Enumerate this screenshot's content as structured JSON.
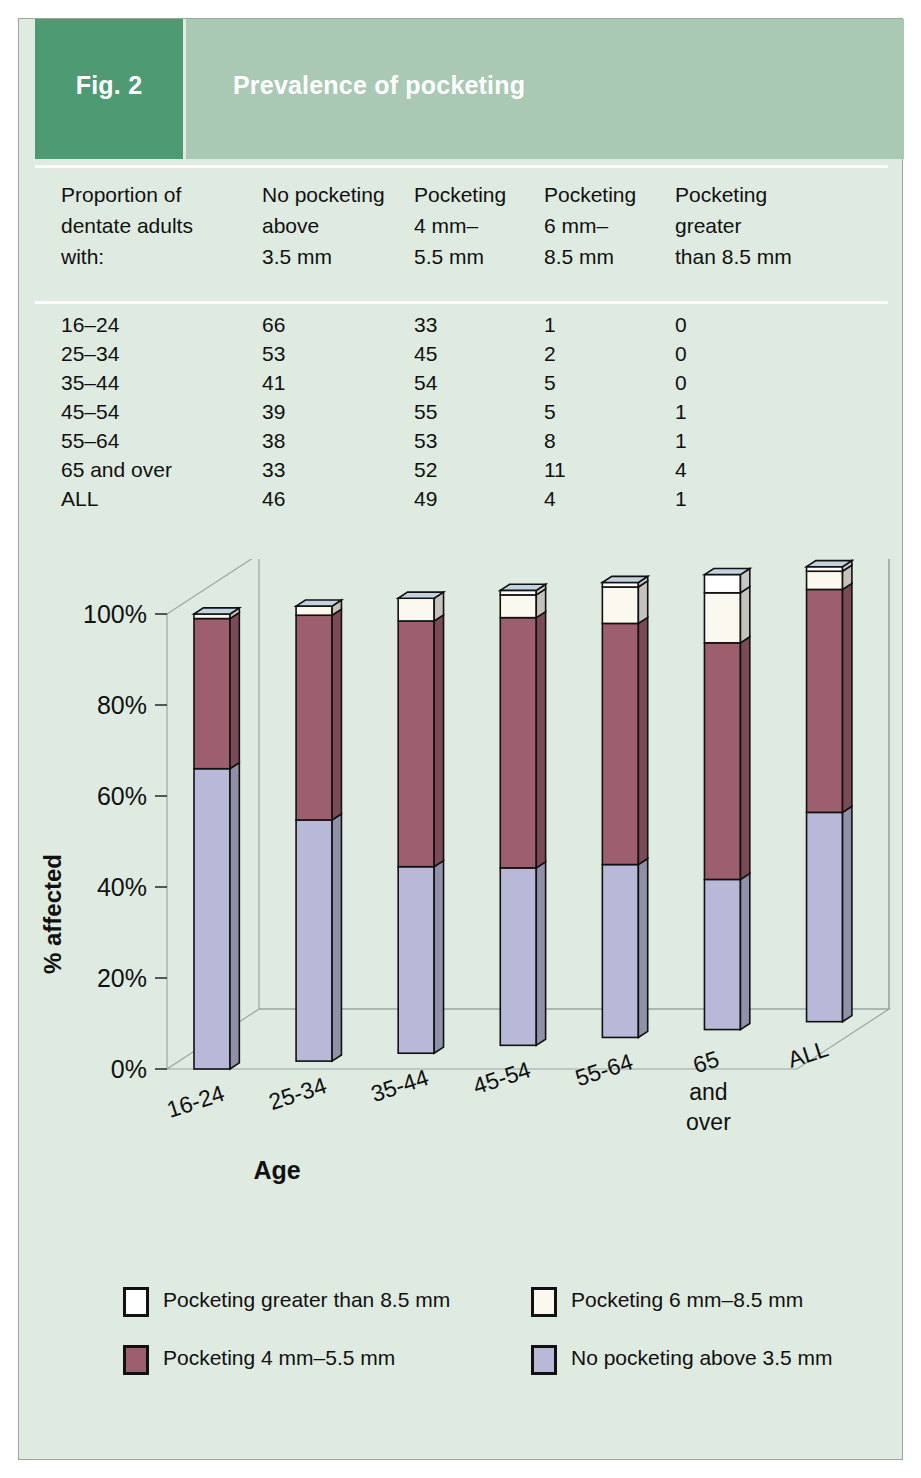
{
  "header": {
    "figure_label": "Fig. 2",
    "title": "Prevalence of pocketing",
    "fig_block_color": "#4e9a72",
    "title_block_color": "#a9c9b5"
  },
  "table": {
    "columns": [
      "Proportion of\ndentate adults\nwith:",
      "No pocketing\nabove\n3.5 mm",
      "Pocketing\n4 mm–\n5.5 mm",
      "Pocketing\n6 mm–\n8.5 mm",
      "Pocketing\ngreater\nthan 8.5 mm"
    ],
    "rows": [
      {
        "age": "16–24",
        "no_pocketing": "66",
        "p4_55": "33",
        "p6_85": "1",
        "p_gt85": "0"
      },
      {
        "age": "25–34",
        "no_pocketing": "53",
        "p4_55": "45",
        "p6_85": "2",
        "p_gt85": "0"
      },
      {
        "age": "35–44",
        "no_pocketing": "41",
        "p4_55": "54",
        "p6_85": "5",
        "p_gt85": "0"
      },
      {
        "age": "45–54",
        "no_pocketing": "39",
        "p4_55": "55",
        "p6_85": "5",
        "p_gt85": "1"
      },
      {
        "age": "55–64",
        "no_pocketing": "38",
        "p4_55": "53",
        "p6_85": "8",
        "p_gt85": "1"
      },
      {
        "age": "65 and over",
        "no_pocketing": "33",
        "p4_55": "52",
        "p6_85": "11",
        "p_gt85": "4"
      },
      {
        "age": "ALL",
        "no_pocketing": "46",
        "p4_55": "49",
        "p6_85": "4",
        "p_gt85": "1"
      }
    ]
  },
  "chart_data": {
    "type": "bar",
    "subtype": "stacked-column-3d",
    "title": "",
    "xlabel": "Age",
    "ylabel": "% affected",
    "ylim": [
      0,
      100
    ],
    "yticks": [
      "0%",
      "20%",
      "40%",
      "60%",
      "80%",
      "100%"
    ],
    "grid": false,
    "legend_position": "bottom",
    "categories": [
      "16-24",
      "25-34",
      "35-44",
      "45-54",
      "55-64",
      "65\nand\nover",
      "ALL"
    ],
    "series": [
      {
        "name": "No pocketing above 3.5 mm",
        "color": "#b8b8d8",
        "values": [
          66,
          53,
          41,
          39,
          38,
          33,
          46
        ]
      },
      {
        "name": "Pocketing 4 mm–5.5 mm",
        "color": "#9d5f6e",
        "values": [
          33,
          45,
          54,
          55,
          53,
          52,
          49
        ]
      },
      {
        "name": "Pocketing 6 mm–8.5 mm",
        "color": "#fbf9ef",
        "values": [
          1,
          2,
          5,
          5,
          8,
          11,
          4
        ]
      },
      {
        "name": "Pocketing greater than 8.5 mm",
        "color": "#ffffff",
        "values": [
          0,
          0,
          0,
          1,
          1,
          4,
          1
        ]
      }
    ],
    "cap_color": "#c3d2e0",
    "side_shade_factor": 0.78
  },
  "legend": {
    "items": [
      {
        "label": "Pocketing greater than 8.5 mm",
        "color": "#ffffff"
      },
      {
        "label": "Pocketing 6 mm–8.5 mm",
        "color": "#fbf9ef"
      },
      {
        "label": "Pocketing 4 mm–5.5 mm",
        "color": "#9d5f6e"
      },
      {
        "label": "No pocketing above 3.5 mm",
        "color": "#b8b8d8"
      }
    ]
  }
}
